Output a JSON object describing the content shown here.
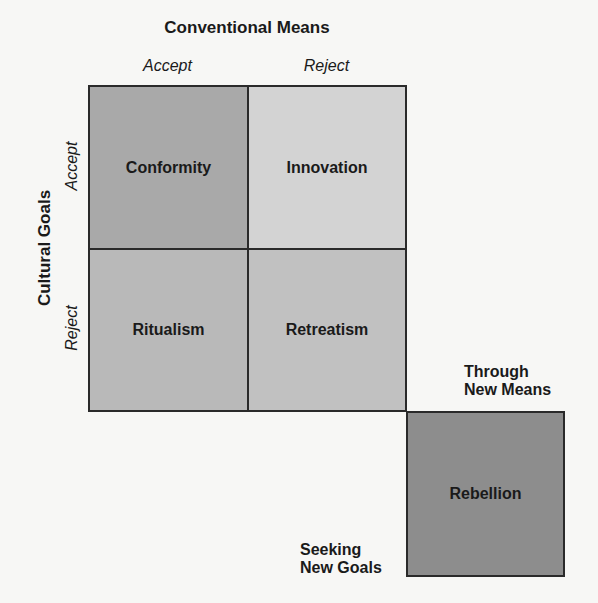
{
  "diagram": {
    "title": "Conventional Means",
    "columns": [
      "Accept",
      "Reject"
    ],
    "side_title": "Cultural Goals",
    "rows": [
      "Accept",
      "Reject"
    ],
    "cells": [
      {
        "label": "Conformity",
        "color": "#a9a9a9"
      },
      {
        "label": "Innovation",
        "color": "#d3d3d3"
      },
      {
        "label": "Ritualism",
        "color": "#b9b9b9"
      },
      {
        "label": "Retreatism",
        "color": "#c1c1c1"
      }
    ],
    "outlier": {
      "label": "Rebellion",
      "color": "#8d8d8d"
    },
    "annotations": {
      "through_line1": "Through",
      "through_line2": "New Means",
      "seeking_line1": "Seeking",
      "seeking_line2": "New Goals"
    }
  }
}
